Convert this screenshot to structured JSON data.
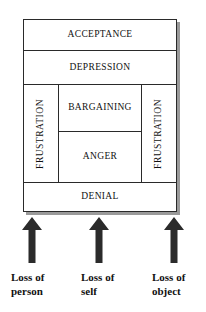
{
  "diagram": {
    "rows": {
      "acceptance": "ACCEPTANCE",
      "depression": "DEPRESSION",
      "bargaining": "BARGAINING",
      "anger": "ANGER",
      "denial": "DENIAL",
      "frustration_left": "FRUSTRATION",
      "frustration_right": "FRUSTRATION"
    },
    "colors": {
      "border": "#2a2a2a",
      "shadow": "#9a9a9a",
      "arrow": "#2b2b2b",
      "text": "#111111",
      "background": "#ffffff"
    }
  },
  "arrows": [
    {
      "name": "arrow-loss-of-person",
      "direction": "up"
    },
    {
      "name": "arrow-loss-of-self",
      "direction": "up"
    },
    {
      "name": "arrow-loss-of-object",
      "direction": "up"
    }
  ],
  "captions": {
    "person": {
      "line1": "Loss of",
      "line2": "person"
    },
    "self": {
      "line1": "Loss of",
      "line2": "self"
    },
    "object": {
      "line1": "Loss of",
      "line2": "object"
    }
  }
}
